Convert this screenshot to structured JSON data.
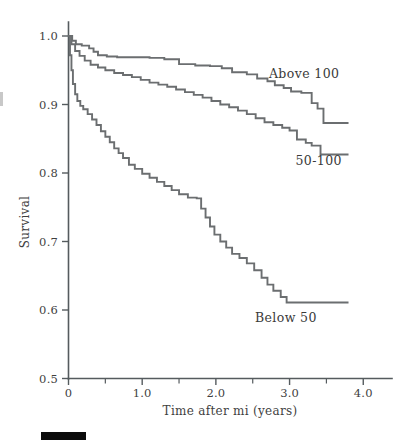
{
  "figure": {
    "background_color": "#ffffff",
    "line_color": "#6b6e70",
    "axis_color": "#555b5e",
    "text_color": "#3f3f3f",
    "footer_bar_color": "#0b0b0b"
  },
  "chart_data": {
    "type": "line",
    "title": "",
    "subtitle": "",
    "xlabel": "Time after mi (years)",
    "ylabel": "Survival",
    "xlim": [
      0,
      4.2
    ],
    "ylim": [
      0.5,
      1.02
    ],
    "grid": false,
    "legend_position": "inline-annotations",
    "xticks": [
      0,
      1.0,
      2.0,
      3.0,
      4.0
    ],
    "xticklabels": [
      "0",
      "1.0",
      "2.0",
      "3.0",
      "4.0"
    ],
    "xminorticks": [
      0.5,
      1.5,
      2.5,
      3.5
    ],
    "yticks": [
      0.5,
      0.6,
      0.7,
      0.8,
      0.9,
      1.0
    ],
    "yticklabels": [
      "0.5",
      "0.6",
      "0.7",
      "0.8",
      "0.9",
      "1.0"
    ],
    "step_type": "post",
    "series": [
      {
        "name": "Above 100",
        "label": "Above 100",
        "annotation_x": 2.72,
        "annotation_y": 0.938,
        "color": "#6b6e70",
        "x": [
          0.0,
          0.05,
          0.1,
          0.18,
          0.28,
          0.34,
          0.4,
          0.52,
          0.66,
          0.86,
          1.1,
          1.3,
          1.5,
          1.72,
          1.92,
          2.08,
          2.22,
          2.42,
          2.56,
          2.7,
          2.8,
          2.92,
          3.02,
          3.16,
          3.3,
          3.38,
          3.46,
          3.8
        ],
        "y": [
          1.0,
          0.993,
          0.988,
          0.986,
          0.982,
          0.977,
          0.972,
          0.97,
          0.969,
          0.969,
          0.968,
          0.966,
          0.959,
          0.957,
          0.956,
          0.953,
          0.947,
          0.944,
          0.938,
          0.934,
          0.928,
          0.924,
          0.919,
          0.917,
          0.902,
          0.894,
          0.873,
          0.873
        ]
      },
      {
        "name": "50-100",
        "label": "50-100",
        "annotation_x": 3.08,
        "annotation_y": 0.812,
        "color": "#6b6e70",
        "x": [
          0.0,
          0.04,
          0.09,
          0.15,
          0.22,
          0.3,
          0.4,
          0.5,
          0.62,
          0.74,
          0.86,
          0.98,
          1.1,
          1.22,
          1.34,
          1.46,
          1.58,
          1.7,
          1.82,
          1.94,
          2.06,
          2.18,
          2.3,
          2.42,
          2.54,
          2.66,
          2.78,
          2.9,
          3.0,
          3.1,
          3.22,
          3.3,
          3.42,
          3.8
        ],
        "y": [
          1.0,
          0.988,
          0.978,
          0.971,
          0.964,
          0.958,
          0.954,
          0.95,
          0.946,
          0.943,
          0.94,
          0.936,
          0.932,
          0.929,
          0.926,
          0.922,
          0.918,
          0.914,
          0.91,
          0.905,
          0.9,
          0.896,
          0.891,
          0.886,
          0.88,
          0.874,
          0.87,
          0.866,
          0.862,
          0.849,
          0.844,
          0.84,
          0.827,
          0.827
        ]
      },
      {
        "name": "Below 50",
        "label": "Below 50",
        "annotation_x": 2.53,
        "annotation_y": 0.582,
        "color": "#6b6e70",
        "x": [
          0.0,
          0.02,
          0.04,
          0.06,
          0.09,
          0.12,
          0.16,
          0.2,
          0.26,
          0.32,
          0.38,
          0.44,
          0.5,
          0.56,
          0.62,
          0.68,
          0.74,
          0.82,
          0.9,
          1.0,
          1.1,
          1.2,
          1.3,
          1.4,
          1.5,
          1.62,
          1.74,
          1.8,
          1.86,
          1.92,
          1.98,
          2.06,
          2.14,
          2.22,
          2.32,
          2.42,
          2.52,
          2.62,
          2.7,
          2.78,
          2.88,
          2.96,
          3.8
        ],
        "y": [
          1.0,
          0.972,
          0.95,
          0.93,
          0.915,
          0.905,
          0.898,
          0.893,
          0.886,
          0.878,
          0.87,
          0.861,
          0.853,
          0.845,
          0.836,
          0.829,
          0.822,
          0.812,
          0.806,
          0.799,
          0.793,
          0.787,
          0.781,
          0.775,
          0.769,
          0.764,
          0.763,
          0.748,
          0.735,
          0.722,
          0.71,
          0.7,
          0.691,
          0.682,
          0.676,
          0.668,
          0.658,
          0.647,
          0.637,
          0.628,
          0.619,
          0.611,
          0.611
        ]
      }
    ]
  },
  "footer": {
    "bar_present": true
  }
}
